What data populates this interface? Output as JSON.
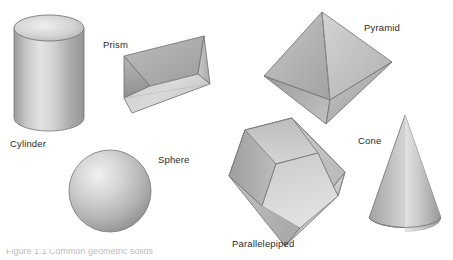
{
  "figure": {
    "title": "Geometric Solids",
    "background_color": "#ffffff",
    "width": 453,
    "height": 260,
    "label_color": "#2b2b2b",
    "partial_caption": "Figure 1.1  Common geometric solids"
  },
  "solids": [
    {
      "id": "cylinder",
      "label": "Cylinder",
      "label_x": 10,
      "label_y": 139,
      "fill_light": "#e3e3e3",
      "fill_mid": "#bdbdbd",
      "fill_dark": "#8f8f8f",
      "stroke": "#6f6f6f"
    },
    {
      "id": "prism",
      "label": "Prism",
      "label_x": 103,
      "label_y": 40,
      "fill_light": "#dcdcdc",
      "fill_mid": "#b8b8b8",
      "fill_dark": "#969696",
      "stroke": "#6f6f6f"
    },
    {
      "id": "pyramid",
      "label": "Pyramid",
      "label_x": 364,
      "label_y": 23,
      "fill_light": "#d8d8d8",
      "fill_mid": "#b0b0b0",
      "fill_dark": "#8a8a8a",
      "stroke": "#6f6f6f"
    },
    {
      "id": "sphere",
      "label": "Sphere",
      "label_x": 158,
      "label_y": 155,
      "fill_light": "#e8e8e8",
      "fill_mid": "#c0c0c0",
      "fill_dark": "#8d8d8d",
      "stroke": "#707070"
    },
    {
      "id": "parallelepiped",
      "label": "Parallelepiped",
      "label_x": 232,
      "label_y": 239,
      "fill_light": "#dfdfdf",
      "fill_mid": "#b5b5b5",
      "fill_dark": "#939393",
      "stroke": "#6f6f6f"
    },
    {
      "id": "cone",
      "label": "Cone",
      "label_x": 358,
      "label_y": 136,
      "fill_light": "#e6e6e6",
      "fill_mid": "#bebebe",
      "fill_dark": "#8e8e8e",
      "stroke": "#6f6f6f"
    }
  ]
}
